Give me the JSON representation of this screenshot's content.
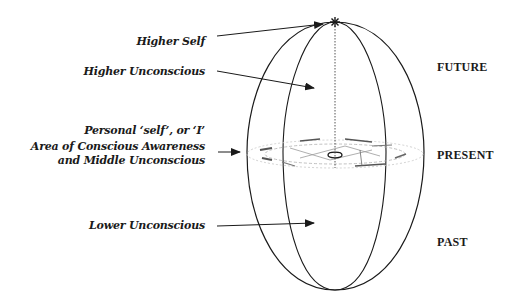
{
  "diagram": {
    "labels": {
      "higher_self": "Higher Self",
      "higher_unconscious": "Higher Unconscious",
      "personal_self": "Personal ‘self’, or ‘I’",
      "conscious_awareness_line1": "Area of Conscious Awareness",
      "conscious_awareness_line2": "and Middle Unconscious",
      "lower_unconscious": "Lower Unconscious"
    },
    "time_labels": {
      "future": "FUTURE",
      "present": "PRESENT",
      "past": "PAST"
    },
    "colors": {
      "ink": "#1a1a1a",
      "band": "#9a9a9a",
      "background": "#ffffff"
    }
  }
}
